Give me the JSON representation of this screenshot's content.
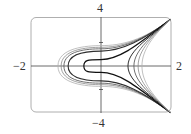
{
  "chart_data": {
    "type": "line",
    "title": "",
    "subtitle": "",
    "xlabel": "",
    "ylabel": "",
    "xlim": [
      -2,
      2
    ],
    "ylim": [
      -4,
      4
    ],
    "grid": false,
    "legend": null,
    "tick_labels": {
      "x_min": "−2",
      "x_max": "2",
      "y_max": "4",
      "y_min": "−4"
    },
    "y_ticks": [
      -2,
      2
    ],
    "series": [
      {
        "name": "left-1",
        "vertex_x": -1.23,
        "shade": "#b0b0b0",
        "width": 0.8,
        "family": "left"
      },
      {
        "name": "left-2",
        "vertex_x": -1.14,
        "shade": "#8a8a8a",
        "width": 0.8,
        "family": "left"
      },
      {
        "name": "left-3",
        "vertex_x": -1.06,
        "shade": "#606060",
        "width": 0.9,
        "family": "left"
      },
      {
        "name": "left-4",
        "vertex_x": -0.94,
        "shade": "#303030",
        "width": 1.1,
        "family": "left"
      },
      {
        "name": "left-5",
        "vertex_x": -0.49,
        "shade": "#111111",
        "width": 1.2,
        "family": "left"
      },
      {
        "name": "right-1",
        "vertex_x": 0.77,
        "shade": "#303030",
        "width": 1.0,
        "family": "right"
      },
      {
        "name": "right-2",
        "vertex_x": 0.94,
        "shade": "#606060",
        "width": 0.9,
        "family": "right"
      },
      {
        "name": "right-3",
        "vertex_x": 1.06,
        "shade": "#8a8a8a",
        "width": 0.8,
        "family": "right"
      },
      {
        "name": "right-4",
        "vertex_x": 1.17,
        "shade": "#b0b0b0",
        "width": 0.8,
        "family": "right"
      }
    ]
  },
  "axes": {
    "label_top": "4",
    "label_bottom": "−4",
    "label_left": "−2",
    "label_right": "2"
  },
  "colors": {
    "frame": "#9a9a9a",
    "axis": "#444444",
    "background": "#ffffff"
  }
}
